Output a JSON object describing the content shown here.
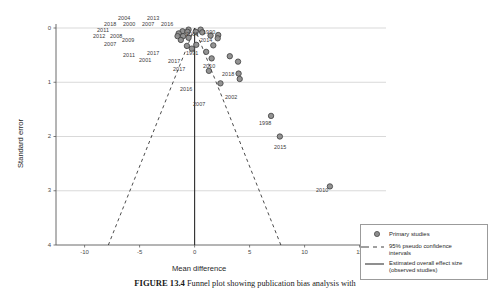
{
  "figure": {
    "caption_bold": "FIGURE 13.4",
    "caption_text": "Funnel plot showing publication bias analysis with"
  },
  "axes": {
    "xlabel": "Mean difference",
    "ylabel": "Standard error",
    "xticks": [
      "-10",
      "-5",
      "0",
      "5",
      "10",
      "15"
    ],
    "xtickvals": [
      -10,
      -5,
      0,
      5,
      10,
      15
    ],
    "yticks": [
      "0",
      "1",
      "2",
      "3",
      "4"
    ],
    "ytickvals": [
      0,
      1,
      2,
      3,
      4
    ],
    "xlim": [
      -12.6,
      17.4
    ],
    "ylim": [
      0,
      4
    ],
    "grid": "horizontal"
  },
  "legend": {
    "position": "bottom-right",
    "items": [
      {
        "key": "circle-marker",
        "label": "Primary studies"
      },
      {
        "key": "dashed-line",
        "label": "95% pseudo confidence",
        "label2": "intervals"
      },
      {
        "key": "solid-line",
        "label": "Estimated overall effect size",
        "label2": "(observed studies)"
      }
    ]
  },
  "colors": {
    "marker_fill": "#8d8d8d",
    "marker_stroke": "#3d3d3d",
    "gridline": "#c9c9c9",
    "axis": "#5a5a5a",
    "effect_line": "#333333",
    "ci_line": "#2b2b2b",
    "background": "#ffffff"
  },
  "chart_data": {
    "type": "scatter",
    "title": "",
    "xlabel": "Mean difference",
    "ylabel": "Standard error",
    "xlim": [
      -12.6,
      17.4
    ],
    "ylim": [
      0,
      4
    ],
    "y_axis_inverted": true,
    "grid": "horizontal",
    "overall_effect": 0.0,
    "ci_slope": 1.96,
    "points": [
      {
        "label": "2004",
        "x": -0.55,
        "y": 0.03
      },
      {
        "label": "2013",
        "x": 0.55,
        "y": 0.03
      },
      {
        "label": "2018",
        "x": -1.1,
        "y": 0.06
      },
      {
        "label": "2000",
        "x": -0.65,
        "y": 0.07
      },
      {
        "label": "2007",
        "x": 0.1,
        "y": 0.07
      },
      {
        "label": "2016",
        "x": 0.7,
        "y": 0.08
      },
      {
        "label": "2011",
        "x": -1.45,
        "y": 0.1
      },
      {
        "label": "2012",
        "x": -1.55,
        "y": 0.15
      },
      {
        "label": "2008",
        "x": -1.05,
        "y": 0.15
      },
      {
        "label": "2009",
        "x": -0.55,
        "y": 0.18
      },
      {
        "label": "2006",
        "x": 1.45,
        "y": 0.14
      },
      {
        "label": "1990",
        "x": 2.15,
        "y": 0.13
      },
      {
        "label": "2014",
        "x": 2.1,
        "y": 0.19
      },
      {
        "label": "2007b",
        "x": -1.25,
        "y": 0.22
      },
      {
        "label": "2011b",
        "x": -0.7,
        "y": 0.33
      },
      {
        "label": "2017",
        "x": 0.15,
        "y": 0.31
      },
      {
        "label": "2001",
        "x": -0.25,
        "y": 0.38
      },
      {
        "label": "1991",
        "x": 1.7,
        "y": 0.32
      },
      {
        "label": "2017b",
        "x": 1.05,
        "y": 0.44
      },
      {
        "label": "2017c",
        "x": 1.55,
        "y": 0.56
      },
      {
        "label": "2010",
        "x": 3.2,
        "y": 0.52
      },
      {
        "label": "2018b",
        "x": 3.95,
        "y": 0.62
      },
      {
        "label": "2016b",
        "x": 1.3,
        "y": 0.79
      },
      {
        "label": "2018c",
        "x": 4.0,
        "y": 0.84
      },
      {
        "label": "2002",
        "x": 4.1,
        "y": 0.94
      },
      {
        "label": "2007c",
        "x": 2.35,
        "y": 1.02
      },
      {
        "label": "1998",
        "x": 6.95,
        "y": 1.62
      },
      {
        "label": "2015",
        "x": 7.75,
        "y": 2.0
      },
      {
        "label": "2010b",
        "x": 12.3,
        "y": 2.92
      }
    ]
  },
  "point_labels": [
    {
      "text": "2004",
      "x": 118,
      "y": 15
    },
    {
      "text": "2013",
      "x": 147,
      "y": 15
    },
    {
      "text": "2018",
      "x": 104,
      "y": 21
    },
    {
      "text": "2000",
      "x": 123,
      "y": 21
    },
    {
      "text": "2007",
      "x": 142,
      "y": 21
    },
    {
      "text": "2016",
      "x": 161,
      "y": 21
    },
    {
      "text": "2011",
      "x": 97,
      "y": 27
    },
    {
      "text": "2012",
      "x": 93,
      "y": 33
    },
    {
      "text": "2008",
      "x": 110,
      "y": 33
    },
    {
      "text": "2009",
      "x": 122,
      "y": 37
    },
    {
      "text": "2006",
      "x": 186,
      "y": 31
    },
    {
      "text": "1990",
      "x": 203,
      "y": 29
    },
    {
      "text": "2014",
      "x": 200,
      "y": 37
    },
    {
      "text": "2007",
      "x": 104,
      "y": 41
    },
    {
      "text": "2011",
      "x": 123,
      "y": 52
    },
    {
      "text": "2017",
      "x": 147,
      "y": 50
    },
    {
      "text": "2001",
      "x": 139,
      "y": 57
    },
    {
      "text": "1991",
      "x": 186,
      "y": 50
    },
    {
      "text": "2017",
      "x": 168,
      "y": 58
    },
    {
      "text": "2017",
      "x": 173,
      "y": 66
    },
    {
      "text": "2010",
      "x": 203,
      "y": 63
    },
    {
      "text": "2018",
      "x": 222,
      "y": 71
    },
    {
      "text": "2016",
      "x": 180,
      "y": 86
    },
    {
      "text": "2002",
      "x": 225,
      "y": 94
    },
    {
      "text": "2007",
      "x": 193,
      "y": 101
    },
    {
      "text": "1998",
      "x": 259,
      "y": 120
    },
    {
      "text": "2015",
      "x": 274,
      "y": 144
    },
    {
      "text": "2010",
      "x": 316,
      "y": 187
    }
  ]
}
